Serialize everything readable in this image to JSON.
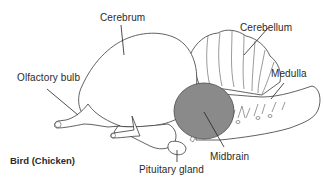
{
  "diagram": {
    "title": "Bird (Chicken)",
    "type": "anatomical brain diagram (lateral view)",
    "labels": [
      {
        "id": "cerebrum",
        "text": "Cerebrum"
      },
      {
        "id": "cerebellum",
        "text": "Cerebellum"
      },
      {
        "id": "olfactory_bulb",
        "text": "Olfactory bulb"
      },
      {
        "id": "medulla",
        "text": "Medulla"
      },
      {
        "id": "midbrain",
        "text": "Midbrain"
      },
      {
        "id": "pituitary_gland",
        "text": "Pituitary gland"
      }
    ],
    "colors": {
      "outline": "#3a3a3a",
      "midbrain_fill": "#8a8a8a",
      "background": "#ffffff",
      "text": "#2a2a2a"
    }
  }
}
